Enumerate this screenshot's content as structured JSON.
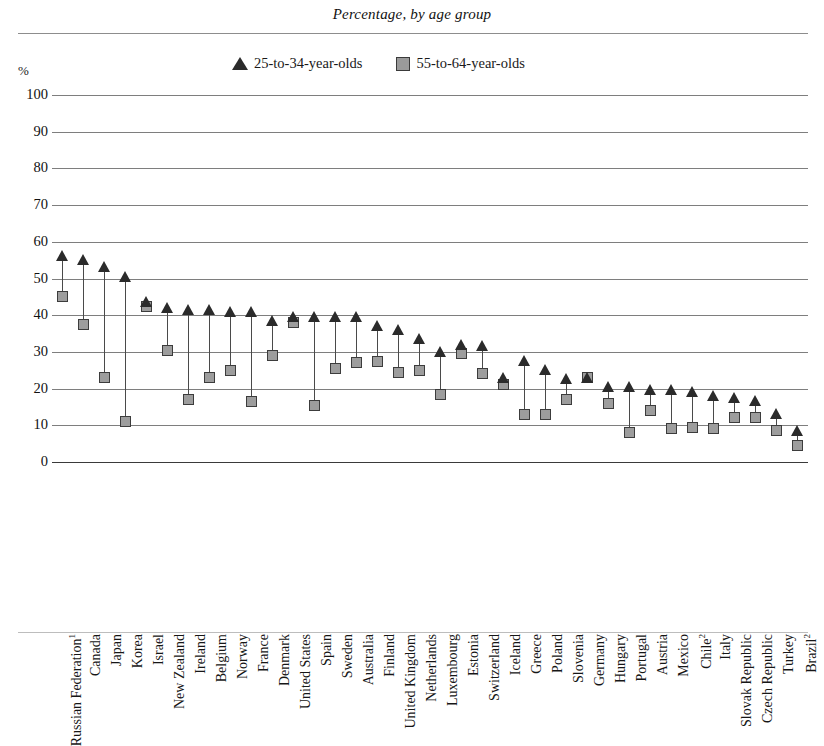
{
  "figure": {
    "title": "Percentage, by age group",
    "axis_unit": "%"
  },
  "legend": {
    "position": "top-center",
    "items": [
      {
        "label": "25-to-34-year-olds",
        "marker": "triangle-marker",
        "color": "#2b2b2b"
      },
      {
        "label": "55-to-64-year-olds",
        "marker": "square-marker",
        "color": "#9a9a9a"
      }
    ]
  },
  "chart_data": {
    "type": "scatter",
    "title": "Percentage, by age group",
    "xlabel": "",
    "ylabel": "%",
    "ylim": [
      0,
      100
    ],
    "yticks": [
      0,
      10,
      20,
      30,
      40,
      50,
      60,
      70,
      80,
      90,
      100
    ],
    "grid": true,
    "categories": [
      "Russian Federation¹",
      "Canada",
      "Japan",
      "Korea",
      "Israel",
      "New Zealand",
      "Ireland",
      "Belgium",
      "Norway",
      "France",
      "Denmark",
      "United States",
      "Spain",
      "Sweden",
      "Australia",
      "Finland",
      "United Kingdom",
      "Netherlands",
      "Luxembourg",
      "Estonia",
      "Switzerland",
      "Iceland",
      "Greece",
      "Poland",
      "Slovenia",
      "Germany",
      "Hungary",
      "Portugal",
      "Austria",
      "Mexico",
      "Chile²",
      "Italy",
      "Slovak Republic",
      "Czech Republic",
      "Turkey",
      "Brazil²"
    ],
    "series": [
      {
        "name": "25-to-34-year-olds",
        "marker": "triangle",
        "color": "#2b2b2b",
        "values": [
          56.0,
          55.0,
          53.0,
          50.5,
          43.5,
          42.0,
          41.5,
          41.5,
          41.0,
          41.0,
          38.5,
          39.5,
          39.5,
          39.5,
          39.5,
          37.0,
          36.0,
          33.5,
          30.0,
          32.0,
          31.5,
          23.0,
          27.5,
          25.0,
          22.5,
          23.0,
          20.5,
          20.5,
          19.5,
          19.5,
          19.0,
          18.0,
          17.5,
          16.5,
          13.0,
          8.5
        ]
      },
      {
        "name": "55-to-64-year-olds",
        "marker": "square",
        "color": "#9a9a9a",
        "values": [
          45.0,
          37.5,
          23.0,
          11.0,
          42.5,
          30.5,
          17.0,
          23.0,
          25.0,
          16.5,
          29.0,
          38.0,
          15.5,
          25.5,
          27.0,
          27.5,
          24.5,
          25.0,
          18.5,
          29.5,
          24.0,
          21.0,
          13.0,
          13.0,
          17.0,
          23.0,
          16.0,
          8.0,
          14.0,
          9.0,
          9.5,
          9.0,
          12.0,
          12.0,
          8.5,
          4.5
        ]
      }
    ]
  }
}
